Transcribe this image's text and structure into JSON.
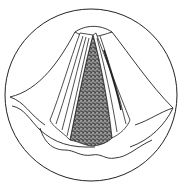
{
  "figure": {
    "subject": "laryngoscopic view of the glottis",
    "colors": {
      "background": "#ffffff",
      "line": "#222222",
      "stipple_fill": "#5a5a5a",
      "stipple_dark": "#2a2a2a"
    },
    "elements": [
      "circular-viewport",
      "epiglottis-fold",
      "left-vocal-cord",
      "right-vocal-cord",
      "glottic-opening-stippled",
      "left-aryepiglottic-fold",
      "right-aryepiglottic-fold",
      "posterior-wavy-fold"
    ]
  }
}
